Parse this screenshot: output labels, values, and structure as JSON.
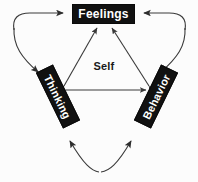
{
  "diagram": {
    "title": "Self",
    "background_color": "#fcfcfc",
    "node_fill_color": "#111111",
    "node_text_color": "#ffffff",
    "line_color": "#3a3a3a",
    "center": {
      "label": "Self"
    },
    "nodes": [
      {
        "id": "feelings",
        "label": "Feelings",
        "position": "top",
        "rotation_deg": 0
      },
      {
        "id": "thinking",
        "label": "Thinking",
        "position": "bottom-left",
        "rotation_deg": 64
      },
      {
        "id": "behavior",
        "label": "Behavior",
        "position": "bottom-right",
        "rotation_deg": -64
      }
    ],
    "inner_connections": [
      {
        "from": "thinking",
        "to": "feelings",
        "arrows": "both"
      },
      {
        "from": "behavior",
        "to": "feelings",
        "arrows": "both"
      },
      {
        "from": "thinking",
        "to": "behavior",
        "arrows": "both"
      }
    ],
    "outer_connections": [
      {
        "from": "thinking",
        "to": "feelings",
        "side": "left",
        "style": "curved"
      },
      {
        "from": "behavior",
        "to": "feelings",
        "side": "right",
        "style": "curved"
      },
      {
        "from": "thinking",
        "to": "behavior",
        "side": "bottom",
        "style": "curved"
      }
    ]
  }
}
